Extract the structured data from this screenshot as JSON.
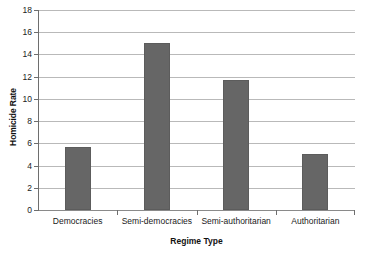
{
  "chart_data": {
    "type": "bar",
    "title": "",
    "xlabel": "Regime Type",
    "ylabel": "Homicide Rate",
    "categories": [
      "Democracies",
      "Semi-democracies",
      "Semi-authoritarian",
      "Authoritarian"
    ],
    "values": [
      5.7,
      15.0,
      11.7,
      5.0
    ],
    "ylim": [
      0,
      18
    ],
    "yticks": [
      0,
      2,
      4,
      6,
      8,
      10,
      12,
      14,
      16,
      18
    ],
    "ytick_labels": [
      "0",
      "2",
      "4",
      "6",
      "8",
      "10",
      "12",
      "14",
      "16",
      "18"
    ],
    "grid": true,
    "legend": false,
    "bar_color": "#666666",
    "gridline_color": "#b9b9b9",
    "axis_color": "#6e6e6e",
    "background": "#ffffff"
  }
}
